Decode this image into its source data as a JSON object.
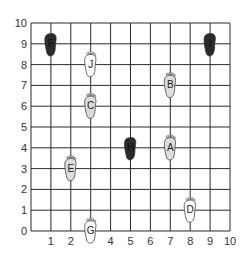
{
  "chart_data": {
    "type": "scatter",
    "title": "",
    "xlabel": "",
    "ylabel": "",
    "xlim": [
      0,
      10
    ],
    "ylim": [
      0,
      10
    ],
    "grid": true,
    "x_ticks": [
      "1",
      "2",
      "3",
      "4",
      "5",
      "6",
      "7",
      "8",
      "9",
      "10"
    ],
    "y_ticks": [
      "0",
      "1",
      "2",
      "3",
      "4",
      "5",
      "6",
      "7",
      "8",
      "9",
      "10"
    ],
    "x_tick_labels_shown": [
      "1",
      "2",
      "4",
      "5",
      "6",
      "7",
      "8",
      "9",
      "10"
    ],
    "points": [
      {
        "label": "F",
        "x": 1,
        "y": 9,
        "shade": "dark"
      },
      {
        "label": "I",
        "x": 9,
        "y": 9,
        "shade": "dark"
      },
      {
        "label": "J",
        "x": 3,
        "y": 8,
        "shade": "white"
      },
      {
        "label": "B",
        "x": 7,
        "y": 7,
        "shade": "light"
      },
      {
        "label": "C",
        "x": 3,
        "y": 6,
        "shade": "light"
      },
      {
        "label": "H",
        "x": 5,
        "y": 4,
        "shade": "dark"
      },
      {
        "label": "A",
        "x": 7,
        "y": 4,
        "shade": "light"
      },
      {
        "label": "E",
        "x": 2,
        "y": 3,
        "shade": "light"
      },
      {
        "label": "D",
        "x": 8,
        "y": 1,
        "shade": "white"
      },
      {
        "label": "G",
        "x": 3,
        "y": 0,
        "shade": "white"
      }
    ]
  },
  "colors": {
    "grid": "#2a2a2a",
    "dark": "#2b2b2b",
    "light": "#dcdcdc",
    "white": "#ffffff",
    "outline": "#444444",
    "tick_text": "#333333"
  },
  "marker": {
    "icon": "footprint-icon"
  }
}
